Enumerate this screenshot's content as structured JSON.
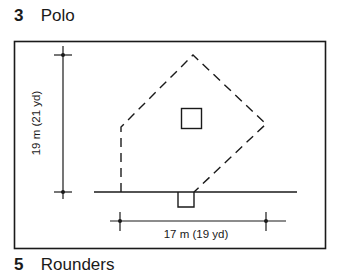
{
  "headings": {
    "top": {
      "number": "3",
      "title": "Polo"
    },
    "bottom": {
      "number": "5",
      "title": "Rounders"
    }
  },
  "diagram": {
    "vertical_dimension_label": "19 m (21 yd)",
    "horizontal_dimension_label": "17 m (19 yd)",
    "ink_color": "#1a1a1a"
  }
}
